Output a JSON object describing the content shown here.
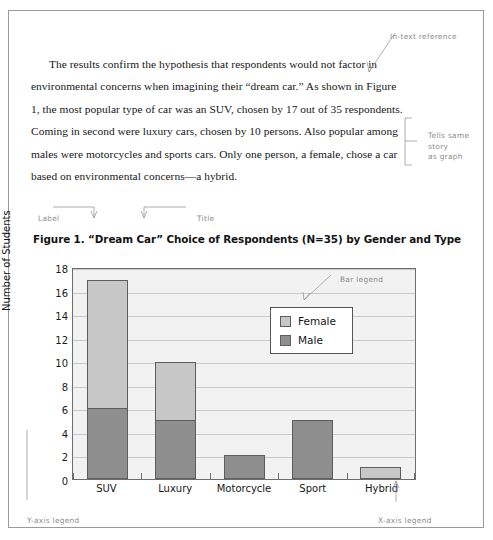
{
  "document": {
    "paragraph": "The results confirm the hypothesis that respondents would not factor in environmental concerns when imagining their “dream car.” As shown in Figure 1, the most popular type of car was an SUV, chosen by 17 out of 35 respondents. Coming in second were luxury cars, chosen by 10 persons. Also popular among males were motorcycles and sports cars. Only one person, a female, chose a car based on environmental concerns—a hybrid."
  },
  "annotations": {
    "in_text_reference": "In-text reference",
    "tells_same_story": "Tells same\nstory\nas graph",
    "label": "Label",
    "title": "Title",
    "bar_legend": "Bar legend",
    "y_axis_legend": "Y-axis legend",
    "x_axis_legend": "X-axis legend"
  },
  "figure": {
    "caption_label": "Figure 1.",
    "caption_title": "“Dream Car” Choice of Respondents (N=35) by Gender and Type",
    "caption_full": "Figure 1.  “Dream Car” Choice of Respondents (N=35) by Gender and Type"
  },
  "colors": {
    "female": "#c7c7c7",
    "male": "#8e8e8e",
    "plot_background": "#f2f2f2",
    "gridline": "#c9c9c9",
    "axis": "#6e6e6e",
    "annotation": "#8d8d8d"
  },
  "chart_data": {
    "type": "bar",
    "subtype": "stacked",
    "title": "“Dream Car” Choice of Respondents (N=35) by Gender and Type",
    "xlabel": "",
    "ylabel": "Number of Students",
    "ylim": [
      0,
      18
    ],
    "yticks": [
      0,
      2,
      4,
      6,
      8,
      10,
      12,
      14,
      16,
      18
    ],
    "ytick_labels": [
      "0",
      "2",
      "4",
      "6",
      "8",
      "10",
      "12",
      "14",
      "16",
      "18"
    ],
    "grid": true,
    "legend_position": "inside-upper-right",
    "categories": [
      "SUV",
      "Luxury",
      "Motorcycle",
      "Sport",
      "Hybrid"
    ],
    "series": [
      {
        "name": "Female",
        "color": "#c7c7c7",
        "values": [
          11,
          5,
          0,
          0,
          1
        ]
      },
      {
        "name": "Male",
        "color": "#8e8e8e",
        "values": [
          6,
          5,
          2,
          5,
          0
        ]
      }
    ],
    "totals": [
      17,
      10,
      2,
      5,
      1
    ]
  }
}
